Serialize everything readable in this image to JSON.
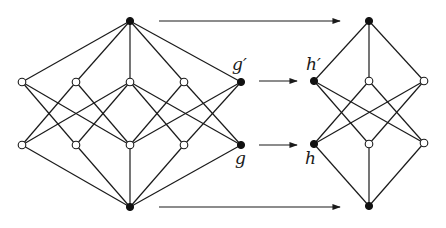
{
  "diagram": {
    "colors": {
      "line": "#1a1a1a",
      "filled_node": "#111111",
      "open_node": "#ffffff"
    },
    "left_lattice": {
      "nodes": [
        {
          "id": "top",
          "x": 130,
          "y": 21,
          "filled": true
        },
        {
          "id": "u1",
          "x": 22,
          "y": 82,
          "filled": false
        },
        {
          "id": "u2",
          "x": 76,
          "y": 82,
          "filled": false
        },
        {
          "id": "u3",
          "x": 130,
          "y": 82,
          "filled": false
        },
        {
          "id": "u4",
          "x": 184,
          "y": 82,
          "filled": false
        },
        {
          "id": "gp",
          "x": 241,
          "y": 82,
          "filled": true
        },
        {
          "id": "l1",
          "x": 22,
          "y": 145,
          "filled": false
        },
        {
          "id": "l2",
          "x": 76,
          "y": 145,
          "filled": false
        },
        {
          "id": "l3",
          "x": 130,
          "y": 145,
          "filled": false
        },
        {
          "id": "l4",
          "x": 184,
          "y": 145,
          "filled": false
        },
        {
          "id": "g",
          "x": 241,
          "y": 145,
          "filled": true
        },
        {
          "id": "bottom",
          "x": 130,
          "y": 207,
          "filled": true
        }
      ],
      "edges": [
        [
          "top",
          "u1"
        ],
        [
          "top",
          "u2"
        ],
        [
          "top",
          "u3"
        ],
        [
          "top",
          "u4"
        ],
        [
          "top",
          "gp"
        ],
        [
          "u1",
          "l2"
        ],
        [
          "u1",
          "l3"
        ],
        [
          "u2",
          "l1"
        ],
        [
          "u2",
          "l3"
        ],
        [
          "u3",
          "l1"
        ],
        [
          "u3",
          "l2"
        ],
        [
          "u3",
          "l4"
        ],
        [
          "u3",
          "g"
        ],
        [
          "u4",
          "l3"
        ],
        [
          "u4",
          "g"
        ],
        [
          "gp",
          "l3"
        ],
        [
          "gp",
          "l4"
        ],
        [
          "l1",
          "bottom"
        ],
        [
          "l2",
          "bottom"
        ],
        [
          "l3",
          "bottom"
        ],
        [
          "l4",
          "bottom"
        ],
        [
          "g",
          "bottom"
        ]
      ],
      "labels": [
        {
          "text": "g′",
          "x": 232,
          "y": 56
        },
        {
          "text": "g",
          "x": 234,
          "y": 153
        }
      ]
    },
    "right_lattice": {
      "nodes": [
        {
          "id": "top",
          "x": 369,
          "y": 21,
          "filled": true
        },
        {
          "id": "hp",
          "x": 314,
          "y": 81,
          "filled": true
        },
        {
          "id": "m1",
          "x": 369,
          "y": 81,
          "filled": false
        },
        {
          "id": "m2",
          "x": 424,
          "y": 81,
          "filled": false
        },
        {
          "id": "h",
          "x": 314,
          "y": 144,
          "filled": true
        },
        {
          "id": "n1",
          "x": 369,
          "y": 144,
          "filled": false
        },
        {
          "id": "n2",
          "x": 424,
          "y": 143,
          "filled": false
        },
        {
          "id": "bottom",
          "x": 369,
          "y": 206,
          "filled": true
        }
      ],
      "edges": [
        [
          "top",
          "hp"
        ],
        [
          "top",
          "m1"
        ],
        [
          "top",
          "m2"
        ],
        [
          "hp",
          "n1"
        ],
        [
          "hp",
          "n2"
        ],
        [
          "m1",
          "h"
        ],
        [
          "m1",
          "n2"
        ],
        [
          "m2",
          "h"
        ],
        [
          "m2",
          "n1"
        ],
        [
          "h",
          "bottom"
        ],
        [
          "n1",
          "bottom"
        ],
        [
          "n2",
          "bottom"
        ]
      ],
      "labels": [
        {
          "text": "h′",
          "x": 307,
          "y": 56
        },
        {
          "text": "h",
          "x": 305,
          "y": 153
        }
      ]
    },
    "arrows": [
      {
        "id": "arrow-top",
        "x1": 159,
        "y1": 21,
        "x2": 340,
        "y2": 21
      },
      {
        "id": "arrow-gp-hp",
        "x1": 259,
        "y1": 81,
        "x2": 297,
        "y2": 81
      },
      {
        "id": "arrow-g-h",
        "x1": 259,
        "y1": 145,
        "x2": 297,
        "y2": 145
      },
      {
        "id": "arrow-bottom",
        "x1": 159,
        "y1": 207,
        "x2": 340,
        "y2": 207
      }
    ],
    "text_labels": {
      "g_prime": "g′",
      "g": "g",
      "h_prime": "h′",
      "h": "h"
    }
  }
}
